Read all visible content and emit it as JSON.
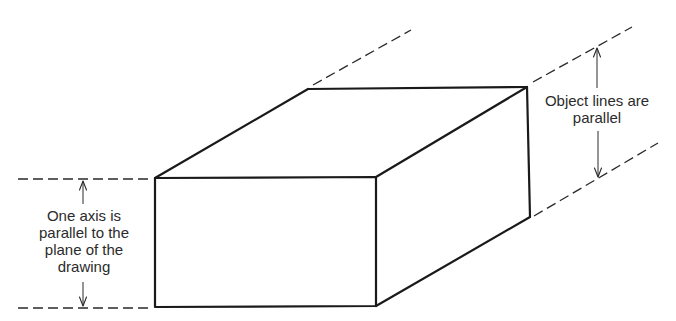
{
  "diagram": {
    "type": "oblique-projection-illustration",
    "labels": {
      "left": {
        "lines": [
          "One axis is",
          "parallel to the",
          "plane of the",
          "drawing"
        ]
      },
      "right": {
        "lines": [
          "Object lines are",
          "parallel"
        ]
      }
    },
    "annotations": [
      {
        "name": "front-face-height-dimension",
        "type": "double-arrow-between-dashed-extension-lines",
        "side": "left"
      },
      {
        "name": "receding-edges-parallel-dimension",
        "type": "double-arrow-between-dashed-extension-lines",
        "side": "right"
      }
    ],
    "colors": {
      "background": "#ffffff",
      "lines": "#1a1a1a",
      "text": "#2b2b2b"
    }
  }
}
